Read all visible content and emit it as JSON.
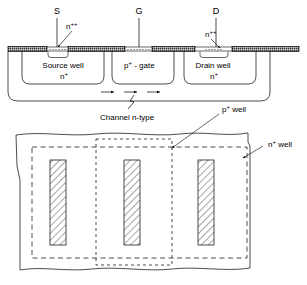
{
  "figure": {
    "colors": {
      "line": "#000000",
      "background": "#ffffff",
      "oxide_fill": "#9a9a9a",
      "hatch": "#000000"
    }
  },
  "cross_section": {
    "terminals": [
      {
        "name": "source-terminal",
        "label": "S",
        "x": 57,
        "y": 12
      },
      {
        "name": "gate-terminal",
        "label": "G",
        "x": 139,
        "y": 12
      },
      {
        "name": "drain-terminal",
        "label": "D",
        "x": 216,
        "y": 12
      }
    ],
    "doping_labels": [
      {
        "name": "source-n-plusplus",
        "text": "n",
        "sup": "++",
        "x": 70,
        "y": 26
      },
      {
        "name": "drain-n-plusplus",
        "text": "n",
        "sup": "++",
        "x": 210,
        "y": 34
      }
    ],
    "regions": [
      {
        "name": "source-well",
        "line1": "Source well",
        "line2": "n",
        "line2_sup": "+",
        "x": 65,
        "y": 70
      },
      {
        "name": "p-plus-gate",
        "text": "p",
        "sup": "+",
        "suffix": " - gate",
        "x": 138,
        "y": 70
      },
      {
        "name": "drain-well",
        "line1": "Drain well",
        "line2": "n",
        "line2_sup": "+",
        "x": 213,
        "y": 70
      }
    ],
    "channel_label": {
      "name": "channel-label",
      "text": "Channel n-type",
      "x": 143,
      "y": 118
    },
    "arrow_count": 3
  },
  "plan_view": {
    "annotations": [
      {
        "name": "p-plus-well-label",
        "text": "p",
        "sup": "+",
        "suffix": " well",
        "x": 222,
        "y": 112
      },
      {
        "name": "n-plus-well-label",
        "text": "n",
        "sup": "+",
        "suffix": " well",
        "x": 268,
        "y": 147
      }
    ],
    "finger_count": 3,
    "fingers": [
      {
        "name": "finger-bar-1",
        "x": 63,
        "width": 16
      },
      {
        "name": "finger-bar-2",
        "x": 138,
        "width": 16
      },
      {
        "name": "finger-bar-3",
        "x": 212,
        "width": 16
      }
    ]
  }
}
